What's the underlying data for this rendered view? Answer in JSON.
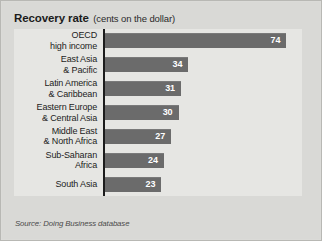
{
  "figure": {
    "title_main": "Recovery rate",
    "title_sub": "(cents on the dollar)",
    "source_prefix": "Source:",
    "source_work": "Doing Business",
    "source_suffix": "database",
    "bar_color": "#6b6b6b",
    "panel_color": "#e6e6e3",
    "background_color": "#d9d9d6",
    "axis_color": "#1c1c1c",
    "value_label_color": "#ffffff"
  },
  "chart_data": {
    "type": "bar",
    "orientation": "horizontal",
    "title": "Recovery rate (cents on the dollar)",
    "xlabel": "",
    "ylabel": "",
    "xlim": [
      0,
      80
    ],
    "grid": false,
    "legend": "none",
    "categories": [
      "OECD\nhigh income",
      "East Asia\n& Pacific",
      "Latin America\n& Caribbean",
      "Eastern Europe\n& Central Asia",
      "Middle East\n& North Africa",
      "Sub-Saharan\nAfrica",
      "South Asia"
    ],
    "values": [
      74,
      34,
      31,
      30,
      27,
      24,
      23
    ],
    "value_labels": [
      "74",
      "34",
      "31",
      "30",
      "27",
      "24",
      "23"
    ]
  }
}
